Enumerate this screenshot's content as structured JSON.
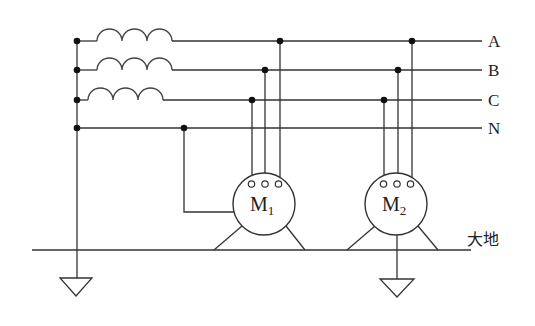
{
  "diagram": {
    "title": "",
    "phase_lines": [
      {
        "label": "A",
        "y": 41
      },
      {
        "label": "B",
        "y": 70
      },
      {
        "label": "C",
        "y": 100
      },
      {
        "label": "N",
        "y": 128
      }
    ],
    "motors": [
      {
        "name": "M",
        "subscript": "1",
        "cx": 264,
        "cy": 204
      },
      {
        "name": "M",
        "subscript": "2",
        "cx": 396,
        "cy": 204
      }
    ],
    "ground_label": "大地",
    "components": [
      "transformer-winding-A",
      "transformer-winding-B",
      "transformer-winding-C",
      "neutral-line",
      "motor-M1",
      "motor-M2",
      "earth-line",
      "ground-symbol-left",
      "ground-symbol-M2"
    ],
    "colors": {
      "line": "#333333",
      "background": "#ffffff"
    }
  }
}
